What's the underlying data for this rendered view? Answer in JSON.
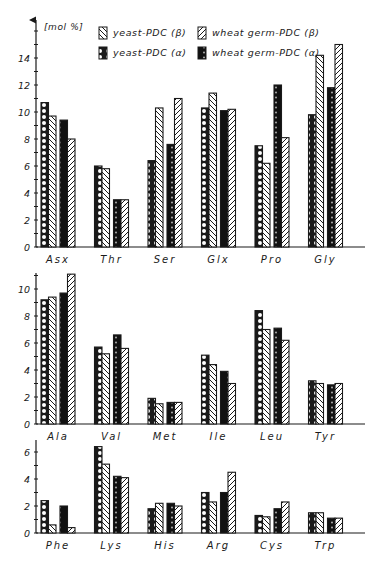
{
  "chart_data": {
    "type": "bar",
    "title": "",
    "ylabel": "[mol %]",
    "xlabel": "",
    "grid": false,
    "legend_position": "top",
    "series_names": [
      "yeast-PDC (α)",
      "yeast-PDC (β)",
      "wheat germ-PDC (α)",
      "wheat germ-PDC (β)"
    ],
    "legend": [
      {
        "label": "yeast-PDC (β)",
        "pattern": "diagonal-back"
      },
      {
        "label": "wheat germ-PDC (β)",
        "pattern": "diagonal-fwd"
      },
      {
        "label": "yeast-PDC (α)",
        "pattern": "open-circles"
      },
      {
        "label": "wheat germ-PDC (α)",
        "pattern": "solid-dots"
      }
    ],
    "panels": [
      {
        "categories": [
          "Asx",
          "Thr",
          "Ser",
          "Glx",
          "Pro",
          "Gly"
        ],
        "ylim": [
          0,
          16
        ],
        "yticks": [
          0,
          2,
          4,
          6,
          8,
          10,
          12,
          14
        ],
        "series": [
          {
            "name": "yeast-PDC (α)",
            "values": [
              10.7,
              6.0,
              6.4,
              10.3,
              7.5,
              9.8
            ]
          },
          {
            "name": "yeast-PDC (β)",
            "values": [
              9.7,
              5.8,
              10.3,
              11.4,
              6.2,
              14.2
            ]
          },
          {
            "name": "wheat germ-PDC (α)",
            "values": [
              9.4,
              3.5,
              7.6,
              10.1,
              12.0,
              11.8
            ]
          },
          {
            "name": "wheat germ-PDC (β)",
            "values": [
              8.0,
              3.5,
              11.0,
              10.2,
              8.1,
              15.0
            ]
          }
        ]
      },
      {
        "categories": [
          "Ala",
          "Val",
          "Met",
          "Ile",
          "Leu",
          "Tyr"
        ],
        "ylim": [
          0,
          11.2
        ],
        "yticks": [
          0,
          2,
          4,
          6,
          8,
          10
        ],
        "series": [
          {
            "name": "yeast-PDC (α)",
            "values": [
              9.2,
              5.7,
              1.9,
              5.1,
              8.4,
              3.2
            ]
          },
          {
            "name": "yeast-PDC (β)",
            "values": [
              9.4,
              5.2,
              1.5,
              4.4,
              7.0,
              3.0
            ]
          },
          {
            "name": "wheat germ-PDC (α)",
            "values": [
              9.7,
              6.6,
              1.6,
              3.9,
              7.1,
              2.9
            ]
          },
          {
            "name": "wheat germ-PDC (β)",
            "values": [
              11.1,
              5.6,
              1.6,
              3.0,
              6.2,
              3.0
            ]
          }
        ]
      },
      {
        "categories": [
          "Phe",
          "Lys",
          "His",
          "Arg",
          "Cys",
          "Trp"
        ],
        "ylim": [
          0,
          6.9
        ],
        "yticks": [
          0,
          2,
          4,
          6
        ],
        "series": [
          {
            "name": "yeast-PDC (α)",
            "values": [
              2.4,
              6.4,
              1.8,
              3.0,
              1.3,
              1.5
            ]
          },
          {
            "name": "yeast-PDC (β)",
            "values": [
              0.6,
              5.1,
              2.2,
              2.3,
              1.2,
              1.5
            ]
          },
          {
            "name": "wheat germ-PDC (α)",
            "values": [
              2.0,
              4.2,
              2.2,
              3.0,
              1.8,
              1.1
            ]
          },
          {
            "name": "wheat germ-PDC (β)",
            "values": [
              0.4,
              4.1,
              2.0,
              4.5,
              2.3,
              1.1
            ]
          }
        ]
      }
    ]
  }
}
